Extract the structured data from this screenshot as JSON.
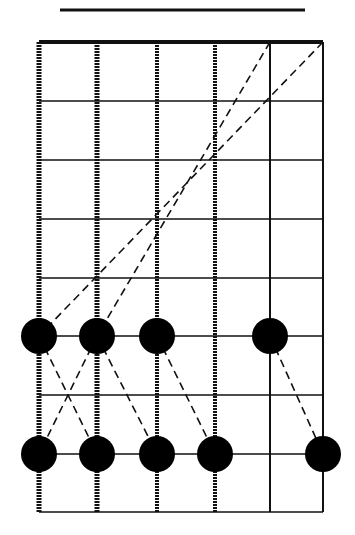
{
  "diagram": {
    "type": "fretboard-scale-pattern",
    "nut_line": {
      "x1": 60,
      "x2": 305,
      "y": 10
    },
    "strings_x": [
      39,
      97,
      157,
      215,
      270,
      323
    ],
    "string_styles": [
      "heavy-wound",
      "heavy-wound",
      "wound",
      "wound",
      "plain",
      "plain"
    ],
    "frets_y": [
      42,
      101,
      160,
      219,
      278,
      336,
      395,
      454,
      512
    ],
    "dots": [
      {
        "string": 1,
        "x": 39,
        "y": 336
      },
      {
        "string": 2,
        "x": 97,
        "y": 336
      },
      {
        "string": 3,
        "x": 157,
        "y": 336
      },
      {
        "string": 5,
        "x": 270,
        "y": 336
      },
      {
        "string": 1,
        "x": 39,
        "y": 454
      },
      {
        "string": 2,
        "x": 97,
        "y": 454
      },
      {
        "string": 3,
        "x": 157,
        "y": 454
      },
      {
        "string": 4,
        "x": 215,
        "y": 454
      },
      {
        "string": 6,
        "x": 323,
        "y": 454
      }
    ],
    "dot_radius": 18,
    "dashed_connections": [
      {
        "from": [
          270,
          42
        ],
        "to": [
          97,
          336
        ]
      },
      {
        "from": [
          323,
          42
        ],
        "to": [
          39,
          336
        ]
      },
      {
        "from": [
          39,
          336
        ],
        "to": [
          97,
          454
        ]
      },
      {
        "from": [
          97,
          336
        ],
        "to": [
          157,
          454
        ]
      },
      {
        "from": [
          157,
          336
        ],
        "to": [
          215,
          454
        ]
      },
      {
        "from": [
          270,
          336
        ],
        "to": [
          323,
          454
        ]
      },
      {
        "from": [
          97,
          336
        ],
        "to": [
          39,
          454
        ]
      }
    ],
    "colors": {
      "line": "#111111",
      "dot": "#000000",
      "background": "#ffffff"
    }
  }
}
